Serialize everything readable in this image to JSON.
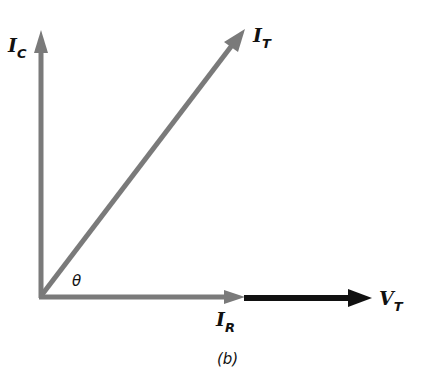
{
  "diagram": {
    "type": "phasor-diagram",
    "caption": "(b)",
    "angle_label": "θ",
    "colors": {
      "current_phasor": "#7a7a7a",
      "voltage_phasor": "#111111",
      "text": "#111111"
    },
    "phasors": [
      {
        "id": "I_C",
        "main": "I",
        "sub": "C",
        "direction": "vertical-up",
        "color": "#7a7a7a"
      },
      {
        "id": "I_T",
        "main": "I",
        "sub": "T",
        "direction": "diagonal",
        "color": "#7a7a7a"
      },
      {
        "id": "I_R",
        "main": "I",
        "sub": "R",
        "direction": "horizontal-right",
        "color": "#7a7a7a"
      },
      {
        "id": "V_T",
        "main": "V",
        "sub": "T",
        "direction": "horizontal-right",
        "color": "#111111"
      }
    ]
  }
}
